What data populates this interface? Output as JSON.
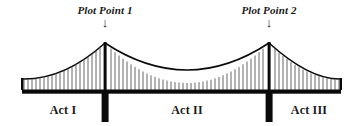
{
  "diagram": {
    "type": "suspension-bridge",
    "colors": {
      "background": "#ffffff",
      "ink": "#0a0a0a",
      "text": "#1a1a1a",
      "suspender": "#555555"
    },
    "plot_points": [
      {
        "id": "plot-point-1",
        "label": "Plot Point 1",
        "arrow_glyph": "↓",
        "x": 105,
        "label_y": 4,
        "arrow_y": 18
      },
      {
        "id": "plot-point-2",
        "label": "Plot Point 2",
        "arrow_glyph": "↓",
        "x": 269,
        "label_y": 4,
        "arrow_y": 18
      }
    ],
    "acts": [
      {
        "id": "act-1",
        "label": "Act I",
        "x": 63,
        "y": 104
      },
      {
        "id": "act-2",
        "label": "Act II",
        "x": 187,
        "y": 104
      },
      {
        "id": "act-3",
        "label": "Act III",
        "x": 309,
        "y": 104
      }
    ],
    "geometry": {
      "deck_y": 90,
      "deck_thickness": 4,
      "deck_left": 22,
      "deck_right": 341,
      "anchor_left_x": 22,
      "anchor_right_x": 341,
      "anchor_top_y": 79,
      "tower_top_y": 42,
      "tower_base_y": 122,
      "tower_width": 3,
      "pier_width": 7,
      "midspan_sag_y": 83,
      "midspan_x": 187,
      "suspender_spacing": 4
    }
  }
}
